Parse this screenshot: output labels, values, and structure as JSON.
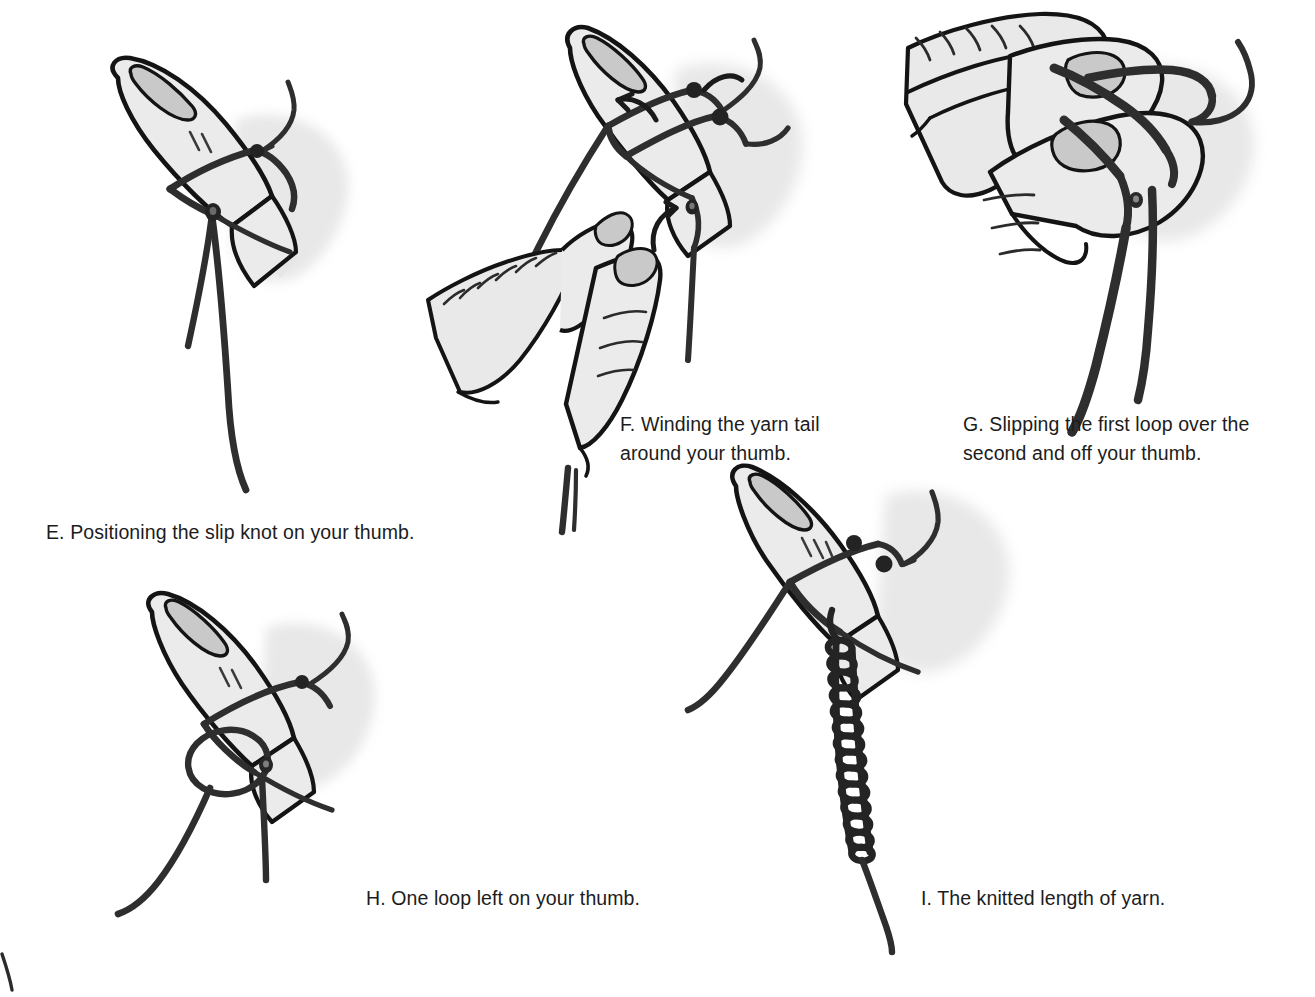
{
  "document": {
    "kind": "illustrated-instruction-sheet",
    "topic": "Finger knitting / casting on with a slip knot",
    "background_color": "#ffffff",
    "text_color": "#1c1c1c"
  },
  "palette": {
    "ink": "#1a1a1a",
    "yarn": "#2e2e2e",
    "skin_fill": "#ebebeb",
    "skin_fill_dark": "#e2e2e2",
    "nail_fill": "#c9c9c9",
    "shadow": "#e0e0e0",
    "outline": "#141414"
  },
  "panels": [
    {
      "id": "E",
      "letter": "E.",
      "caption": "E. Positioning the slip knot on your thumb.",
      "caption_x": 46,
      "caption_y": 518,
      "figure_name": "thumb-with-slip-knot",
      "elements": [
        "thumb",
        "thumbnail",
        "knuckle-lines",
        "yarn-loop",
        "slip-knot",
        "yarn-tail-short",
        "yarn-tail-long",
        "cast-shadow"
      ]
    },
    {
      "id": "F",
      "letter": "F.",
      "caption": "F. Winding the yarn tail\naround your thumb.",
      "caption_x": 620,
      "caption_y": 410,
      "figure_name": "winding-yarn-around-thumb",
      "elements": [
        "thumb",
        "thumbnail",
        "yarn-wrap-upper",
        "yarn-wrap-lower",
        "direction-arrow-upper",
        "direction-arrow-lower",
        "second-hand-pinching-yarn",
        "yarn-strand-vertical",
        "cast-shadow"
      ]
    },
    {
      "id": "G",
      "letter": "G.",
      "caption": "G. Slipping the first loop over the\nsecond and off your thumb.",
      "caption_x": 963,
      "caption_y": 410,
      "figure_name": "slipping-loop-over-second",
      "elements": [
        "rotated-hand",
        "index-finger",
        "thumb-sideways",
        "yarn-loop-crossing",
        "yarn-strand-left",
        "yarn-strand-right",
        "yarn-tail-hook",
        "cast-shadow"
      ]
    },
    {
      "id": "H",
      "letter": "H.",
      "caption": "H. One loop left on your thumb.",
      "caption_x": 366,
      "caption_y": 884,
      "figure_name": "one-loop-left-on-thumb",
      "elements": [
        "thumb",
        "thumbnail",
        "knuckle-lines",
        "yarn-band",
        "open-loop",
        "small-knot",
        "yarn-tail-left",
        "yarn-tail-down",
        "cast-shadow"
      ]
    },
    {
      "id": "I",
      "letter": "I.",
      "caption": "I. The knitted length of yarn.",
      "caption_x": 921,
      "caption_y": 884,
      "figure_name": "knitted-length-of-yarn",
      "elements": [
        "thumb",
        "thumbnail",
        "knuckle-lines",
        "yarn-band",
        "knot-bead-upper",
        "knot-bead-lower",
        "knitted-chain",
        "yarn-tail-left",
        "yarn-tail-bottom",
        "cast-shadow"
      ],
      "chain_link_count": 14
    }
  ],
  "stray_mark": {
    "name": "stray-pen-mark",
    "x": 0,
    "y": 955,
    "description": "small stray ink stroke at lower-left corner"
  }
}
